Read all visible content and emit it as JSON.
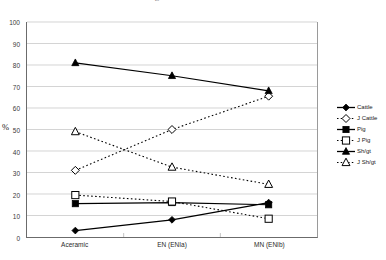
{
  "caption_remnant": "faint cut-off line of text above the figure",
  "axis": {
    "y_title": "%",
    "y_ticks": [
      0,
      10,
      20,
      30,
      40,
      50,
      60,
      70,
      80,
      90,
      100
    ],
    "x_ticks": [
      "Aceramic",
      "EN (ENIa)",
      "MN (ENIb)"
    ]
  },
  "legend": {
    "items": [
      {
        "label": "Cattle",
        "marker": "filled-diamond",
        "line": "solid",
        "color": "#000000"
      },
      {
        "label": "J Cattle",
        "marker": "open-diamond",
        "line": "dotted",
        "color": "#000000"
      },
      {
        "label": "Pig",
        "marker": "filled-square",
        "line": "solid",
        "color": "#000000"
      },
      {
        "label": "J Pig",
        "marker": "open-square",
        "line": "dotted",
        "color": "#000000"
      },
      {
        "label": "Sh/gt",
        "marker": "filled-triangle",
        "line": "solid",
        "color": "#000000"
      },
      {
        "label": "J Sh/gt",
        "marker": "open-triangle",
        "line": "dotted",
        "color": "#000000"
      }
    ]
  },
  "chart_data": {
    "type": "line",
    "title": "",
    "subtitle": "",
    "xlabel": "",
    "ylabel": "%",
    "categories": [
      "Aceramic",
      "EN (ENIa)",
      "MN (ENIb)"
    ],
    "ylim": [
      0,
      100
    ],
    "ytick_step": 10,
    "grid": "horizontal",
    "legend_position": "right",
    "series": [
      {
        "name": "Cattle",
        "values": [
          3,
          8,
          16
        ],
        "marker": "filled-diamond",
        "line": "solid",
        "color": "#000000"
      },
      {
        "name": "J Cattle",
        "values": [
          31,
          50,
          65.5
        ],
        "marker": "open-diamond",
        "line": "dotted",
        "color": "#000000"
      },
      {
        "name": "Pig",
        "values": [
          15.5,
          16,
          15
        ],
        "marker": "filled-square",
        "line": "solid",
        "color": "#000000"
      },
      {
        "name": "J Pig",
        "values": [
          19.5,
          16.5,
          8.5
        ],
        "marker": "open-square",
        "line": "dotted",
        "color": "#000000"
      },
      {
        "name": "Sh/gt",
        "values": [
          81,
          75,
          68
        ],
        "marker": "filled-triangle",
        "line": "solid",
        "color": "#000000"
      },
      {
        "name": "J Sh/gt",
        "values": [
          49,
          32.5,
          24.5
        ],
        "marker": "open-triangle",
        "line": "dotted",
        "color": "#000000"
      }
    ]
  }
}
